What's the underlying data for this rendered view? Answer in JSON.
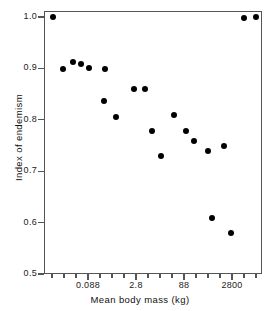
{
  "chart_data": {
    "type": "scatter",
    "title": "",
    "xlabel": "Mean body mass (kg)",
    "ylabel": "Index of endemism",
    "xscale": "log",
    "yscale": "linear",
    "ylim": [
      0.5,
      1.0
    ],
    "yticks": [
      0.5,
      0.6,
      0.7,
      0.8,
      0.9,
      1.0
    ],
    "ytick_labels": [
      "0.5",
      "0.6",
      "0.7",
      "0.8",
      "0.9",
      "1.0"
    ],
    "xtick_labels": [
      "0.088",
      "2.8",
      "88",
      "2800"
    ],
    "xtick_values": [
      0.088,
      2.8,
      88,
      2800
    ],
    "grid": false,
    "legend": null,
    "marker": "filled-circle",
    "marker_color": "#000000",
    "points": [
      {
        "x": 0.0028,
        "y": 1.0
      },
      {
        "x": 0.0088,
        "y": 0.9
      },
      {
        "x": 0.028,
        "y": 0.928
      },
      {
        "x": 0.055,
        "y": 0.918
      },
      {
        "x": 0.11,
        "y": 0.905
      },
      {
        "x": 0.38,
        "y": 0.9
      },
      {
        "x": 0.2,
        "y": 0.84
      },
      {
        "x": 0.9,
        "y": 0.808
      },
      {
        "x": 2.2,
        "y": 0.86
      },
      {
        "x": 3.4,
        "y": 0.86
      },
      {
        "x": 5.5,
        "y": 0.778
      },
      {
        "x": 9.5,
        "y": 0.73
      },
      {
        "x": 22,
        "y": 0.811
      },
      {
        "x": 55,
        "y": 0.778
      },
      {
        "x": 100,
        "y": 0.758
      },
      {
        "x": 280,
        "y": 0.738
      },
      {
        "x": 330,
        "y": 0.608
      },
      {
        "x": 800,
        "y": 0.748
      },
      {
        "x": 1200,
        "y": 0.58
      },
      {
        "x": 3000,
        "y": 0.998
      },
      {
        "x": 5500,
        "y": 1.0
      }
    ],
    "pixel_points": [
      {
        "px": 53,
        "py": 17
      },
      {
        "px": 63,
        "py": 69
      },
      {
        "px": 73,
        "py": 62
      },
      {
        "px": 81,
        "py": 64
      },
      {
        "px": 89,
        "py": 68
      },
      {
        "px": 105,
        "py": 69
      },
      {
        "px": 104,
        "py": 101
      },
      {
        "px": 116,
        "py": 117
      },
      {
        "px": 134,
        "py": 89
      },
      {
        "px": 145,
        "py": 89
      },
      {
        "px": 152,
        "py": 131
      },
      {
        "px": 161,
        "py": 156
      },
      {
        "px": 174,
        "py": 115
      },
      {
        "px": 186,
        "py": 131
      },
      {
        "px": 194,
        "py": 141
      },
      {
        "px": 208,
        "py": 151
      },
      {
        "px": 212,
        "py": 218
      },
      {
        "px": 224,
        "py": 146
      },
      {
        "px": 231,
        "py": 233
      },
      {
        "px": 244,
        "py": 18
      },
      {
        "px": 256,
        "py": 17
      }
    ],
    "y_axis_pixels": {
      "y_at_1.0": 17,
      "y_at_0.5": 274
    },
    "x_minor_tick_px": [
      52,
      64,
      76,
      88,
      100,
      112,
      124,
      136,
      148,
      160,
      172,
      184,
      196,
      208,
      220,
      232,
      244,
      256
    ],
    "x_major_tick_px": [
      88,
      136,
      184,
      232
    ]
  }
}
